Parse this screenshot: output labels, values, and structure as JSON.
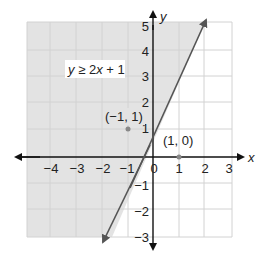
{
  "chart_data": {
    "type": "inequality-graph",
    "title": "",
    "inequality": "y ≥ 2x + 1",
    "boundary_line": {
      "slope": 2,
      "intercept": 1,
      "style": "solid",
      "color": "#555555",
      "arrows": "both"
    },
    "shaded_region": "above/left of line (y ≥ 2x + 1)",
    "xlabel": "x",
    "ylabel": "y",
    "xlim": [
      -4.5,
      3.5
    ],
    "ylim": [
      -3.5,
      5.5
    ],
    "x_ticks": [
      -4,
      -3,
      -2,
      -1,
      0,
      1,
      2,
      3
    ],
    "y_ticks": [
      -3,
      -2,
      -1,
      1,
      2,
      3,
      4,
      5
    ],
    "grid": true,
    "points": [
      {
        "label": "(−1, 1)",
        "x": -1,
        "y": 1
      },
      {
        "label": "(1, 0)",
        "x": 1,
        "y": 0
      }
    ],
    "colors": {
      "shade": "#e3e3e3",
      "grid": "#d0d0d0",
      "axis": "#111111",
      "line": "#555555",
      "point": "#888888"
    }
  },
  "labels": {
    "inequality": "y ≥ 2x + 1",
    "x_axis": "x",
    "y_axis": "y",
    "point_a": "(−1, 1)",
    "point_b": "(1, 0)",
    "x_ticks": [
      "−4",
      "−3",
      "−2",
      "−1",
      "0",
      "1",
      "2",
      "3"
    ],
    "y_ticks": [
      "5",
      "4",
      "3",
      "2",
      "1",
      "−1",
      "−2",
      "−3"
    ]
  }
}
